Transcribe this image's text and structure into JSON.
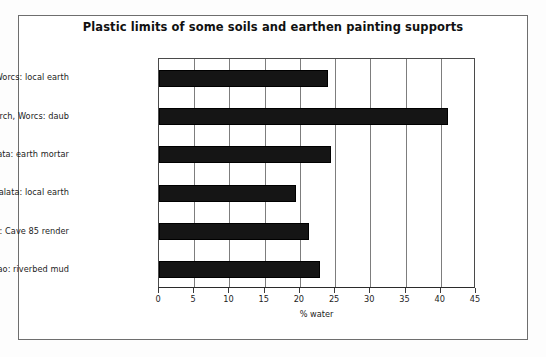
{
  "chart_data": {
    "type": "bar",
    "orientation": "horizontal",
    "title": "Plastic limits of some soils and earthen painting supports",
    "xlabel": "% water",
    "ylabel": "",
    "xlim": [
      0,
      45
    ],
    "xticks": [
      0,
      5,
      10,
      15,
      20,
      25,
      30,
      35,
      40,
      45
    ],
    "xtick_labels": [
      "0",
      "5",
      "10",
      "15",
      "20",
      "25",
      "30",
      "35",
      "40",
      "45"
    ],
    "grid": true,
    "grid_axis": "x",
    "legend": false,
    "bar_color": "#151515",
    "categories": [
      "UK:Alvechurch, Worcs: local earth",
      "UK Alvechurch, Worcs: daub",
      "Cyprus: Galata: earth mortar",
      "Cyprus: Galata: local earth",
      "China: Mogao: Cave 85 render",
      "China: Mogao: riverbed mud"
    ],
    "values": [
      24.0,
      41.0,
      24.4,
      19.5,
      21.3,
      22.9
    ]
  }
}
